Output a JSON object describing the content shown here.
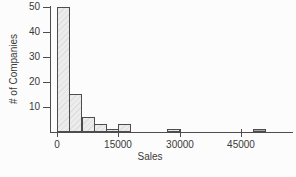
{
  "chart_data": {
    "type": "bar",
    "subtype": "histogram",
    "title": "",
    "xlabel": "Sales",
    "ylabel": "# of Companies",
    "xlim": [
      0,
      54000
    ],
    "ylim": [
      0,
      50
    ],
    "bin_width": 3000,
    "grid": false,
    "legend": false,
    "x_ticks": [
      {
        "value": 0,
        "label": "0"
      },
      {
        "value": 15000,
        "label": "15000"
      },
      {
        "value": 30000,
        "label": "30000"
      },
      {
        "value": 45000,
        "label": "45000"
      }
    ],
    "y_ticks": [
      {
        "value": 10,
        "label": "10"
      },
      {
        "value": 20,
        "label": "20"
      },
      {
        "value": 30,
        "label": "30"
      },
      {
        "value": 40,
        "label": "40"
      },
      {
        "value": 50,
        "label": "50"
      }
    ],
    "bins": [
      {
        "start": 0,
        "end": 3000,
        "count": 50
      },
      {
        "start": 3000,
        "end": 6000,
        "count": 15
      },
      {
        "start": 6000,
        "end": 9000,
        "count": 6
      },
      {
        "start": 9000,
        "end": 12000,
        "count": 3
      },
      {
        "start": 12000,
        "end": 15000,
        "count": 1
      },
      {
        "start": 15000,
        "end": 18000,
        "count": 3
      },
      {
        "start": 27000,
        "end": 30000,
        "count": 1
      },
      {
        "start": 48000,
        "end": 51000,
        "count": 1,
        "fill": "#a8a8a8"
      }
    ],
    "colors": {
      "bar_fill": "#ececec",
      "bar_border": "#4d4d4d",
      "axis": "#4d4d4d",
      "text": "#3a3a3a",
      "background": "#fcfcfc"
    }
  }
}
